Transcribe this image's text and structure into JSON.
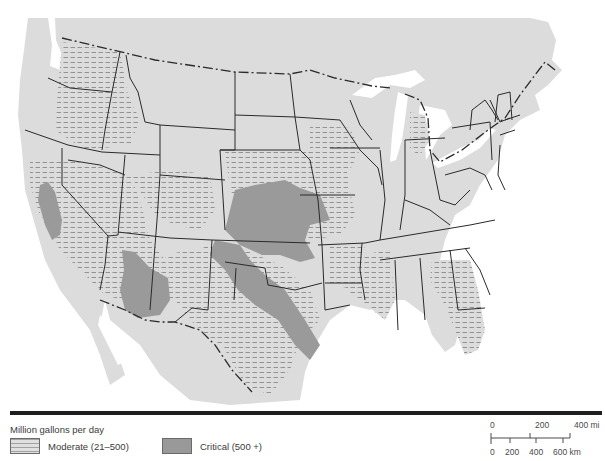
{
  "map": {
    "subject": "United States water-use deficit regions",
    "colors": {
      "land": "#dcdcdc",
      "water": "#ffffff",
      "moderate_fill": "#dcdcdc",
      "moderate_hatch": "#8a8a8a",
      "critical_fill": "#9a9a9a",
      "border": "#2a2a2a"
    },
    "features": {
      "critical_regions": [
        "California Central Valley",
        "Southern Arizona",
        "High Plains (Nebraska/Kansas/Colorado)",
        "Texas Panhandle to Central Texas"
      ],
      "moderate_regions": [
        "Pacific Northwest interior",
        "Great Basin / Nevada",
        "Southern California",
        "Utah/Colorado",
        "Dakotas/Nebraska",
        "Iowa/Missouri",
        "Arkansas/Louisiana/Mississippi delta",
        "Georgia/Florida",
        "Lower Michigan",
        "Gulf coast Texas"
      ]
    }
  },
  "legend": {
    "title": "Million gallons per day",
    "items": [
      {
        "label": "Moderate (21–500)",
        "style": "hatched"
      },
      {
        "label": "Critical (500 +)",
        "style": "solid-gray"
      }
    ]
  },
  "scale_bar": {
    "miles": {
      "ticks": [
        "0",
        "200",
        "400 mi"
      ]
    },
    "kilometers": {
      "ticks": [
        "0",
        "200",
        "400",
        "600 km"
      ]
    }
  }
}
